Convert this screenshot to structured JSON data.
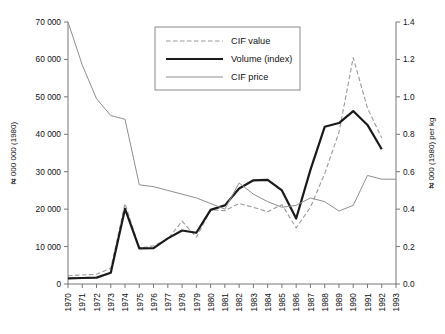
{
  "chart_data": {
    "type": "line",
    "title": "",
    "xlabel": "",
    "ylabel": "₦ 000 000 (1980)",
    "y2label": "₦ 000 (1980) per kg",
    "grid": false,
    "legend_position": "top-center",
    "x": [
      1970,
      1971,
      1972,
      1973,
      1974,
      1975,
      1976,
      1977,
      1978,
      1979,
      1980,
      1981,
      1982,
      1983,
      1984,
      1985,
      1986,
      1987,
      1988,
      1989,
      1990,
      1991,
      1992,
      1993
    ],
    "xtick_labels": [
      "1970",
      "1971",
      "1972",
      "1973",
      "1974",
      "1975",
      "1976",
      "1977",
      "1978",
      "1979",
      "1980",
      "1981",
      "1982",
      "1983",
      "1984",
      "1985",
      "1986",
      "1987",
      "1988",
      "1989",
      "1990",
      "1991",
      "1992",
      "1993"
    ],
    "ylim": [
      0,
      70000
    ],
    "ytick_values": [
      0,
      10000,
      20000,
      30000,
      40000,
      50000,
      60000,
      70000
    ],
    "ytick_labels": [
      "0",
      "10 000",
      "20 000",
      "30 000",
      "40 000",
      "50 000",
      "60 000",
      "70 000"
    ],
    "y2lim": [
      0.0,
      1.4
    ],
    "y2tick_values": [
      0.0,
      0.2,
      0.4,
      0.6,
      0.8,
      1.0,
      1.2,
      1.4
    ],
    "y2tick_labels": [
      "0.0",
      "0.2",
      "0.4",
      "0.6",
      "0.8",
      "1.0",
      "1.2",
      "1.4"
    ],
    "series": [
      {
        "name": "CIF value",
        "axis": "left",
        "style": "dashed",
        "color": "#9a9a9a",
        "width": 1.1,
        "values": [
          2200,
          2400,
          2600,
          4200,
          21500,
          9600,
          10200,
          12000,
          16800,
          12500,
          19800,
          19600,
          21500,
          20500,
          19300,
          21200,
          15000,
          20500,
          29500,
          40500,
          60500,
          47000,
          39000,
          null
        ]
      },
      {
        "name": "Volume (index)",
        "axis": "left",
        "style": "solid",
        "color": "#1a1a1a",
        "width": 2.2,
        "values": [
          1500,
          1600,
          1700,
          3000,
          20100,
          9500,
          9600,
          12200,
          14300,
          13700,
          19800,
          21000,
          25500,
          27700,
          27800,
          25000,
          17500,
          30500,
          42000,
          43000,
          46200,
          42500,
          36000,
          null
        ]
      },
      {
        "name": "CIF price",
        "axis": "right",
        "style": "thin",
        "color": "#8f8f8f",
        "width": 1.0,
        "values": [
          1.4,
          1.17,
          0.99,
          0.9,
          0.88,
          0.53,
          0.52,
          0.5,
          0.48,
          0.46,
          0.43,
          0.4,
          0.54,
          0.48,
          0.44,
          0.41,
          0.42,
          0.46,
          0.44,
          0.39,
          0.42,
          0.58,
          0.56,
          0.56
        ]
      }
    ]
  },
  "legend": {
    "items": [
      {
        "label": "CIF value"
      },
      {
        "label": "Volume (index)"
      },
      {
        "label": "CIF price"
      }
    ]
  },
  "axes": {
    "left_title": "₦ 000 000 (1980)",
    "right_title": "₦ 000 (1980) per kg"
  }
}
